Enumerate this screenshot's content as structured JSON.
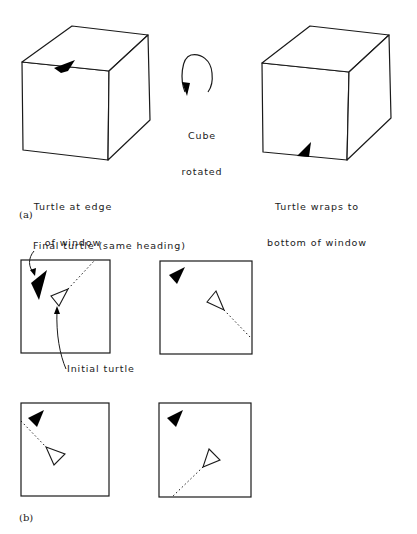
{
  "panel_a": {
    "label": "(a)",
    "left_caption_line1": "Turtle at edge",
    "left_caption_line2": "of window",
    "rotation_caption_line1": "Cube",
    "rotation_caption_line2": "rotated",
    "right_caption_line1": "Turtle wraps to",
    "right_caption_line2": "bottom of window"
  },
  "panel_b": {
    "label": "(b)",
    "final_turtle_annotation": "Final turtle (same heading)",
    "initial_turtle_annotation": "Initial turtle",
    "windows": [
      {
        "id": "top-left",
        "path_exit": "top-right edge"
      },
      {
        "id": "top-right",
        "path_exit": "right edge"
      },
      {
        "id": "bottom-left",
        "path_exit": "left edge"
      },
      {
        "id": "bottom-right",
        "path_exit": "bottom edge"
      }
    ]
  },
  "colors": {
    "line": "#1a1a1a",
    "turtle_fill": "#000000",
    "background": "#ffffff"
  }
}
